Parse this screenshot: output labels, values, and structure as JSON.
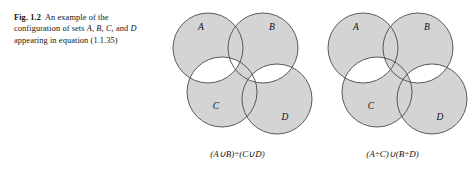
{
  "caption": {
    "label": "Fig. 1.2",
    "text_parts": [
      "An example of the",
      "configuration of sets ",
      "A, B, C,",
      "and ",
      "D",
      " appearing in",
      "equation (1.1.35)"
    ],
    "full_text": "Fig. 1.2 An example of the configuration of sets A, B, C, and D appearing in equation (1.1.35)"
  },
  "style": {
    "fill_shaded": "#d4d4d4",
    "fill_unshaded": "#ffffff",
    "stroke": "#4a4a4a",
    "stroke_width": 0.9,
    "text_color": "#141414"
  },
  "diagrams": [
    {
      "id": "left",
      "formula": "(A∪B)÷(C∪D)",
      "formula_tokens": [
        "(",
        "A",
        "∪",
        "B",
        ")",
        "÷",
        "(",
        "C",
        "∪",
        "D",
        ")"
      ],
      "description": "symmetric difference of the union of A and B with the union of C and D",
      "circles": [
        {
          "name": "A",
          "cx": 48,
          "cy": 44,
          "r": 35,
          "label": "A",
          "label_x": 41,
          "label_y": 26
        },
        {
          "name": "B",
          "cx": 103,
          "cy": 44,
          "r": 35,
          "label": "B",
          "label_x": 112,
          "label_y": 26
        },
        {
          "name": "C",
          "cx": 62,
          "cy": 88,
          "r": 35,
          "label": "C",
          "label_x": 56,
          "label_y": 105
        },
        {
          "name": "D",
          "cx": 117,
          "cy": 95,
          "r": 35,
          "label": "D",
          "label_x": 125,
          "label_y": 116
        }
      ],
      "unshaded_lenses": [
        [
          "A",
          "C"
        ],
        [
          "B",
          "D"
        ]
      ],
      "unshaded_mode": "full-lens"
    },
    {
      "id": "right",
      "formula": "(A÷C)∪(B÷D)",
      "formula_tokens": [
        "(",
        "A",
        "÷",
        "C",
        ")",
        "∪",
        "(",
        "B",
        "÷",
        "D",
        ")"
      ],
      "description": "union of the symmetric difference of A and C with the symmetric difference of B and D",
      "circles": [
        {
          "name": "A",
          "cx": 48,
          "cy": 44,
          "r": 35,
          "label": "A",
          "label_x": 41,
          "label_y": 26
        },
        {
          "name": "B",
          "cx": 103,
          "cy": 44,
          "r": 35,
          "label": "B",
          "label_x": 112,
          "label_y": 26
        },
        {
          "name": "C",
          "cx": 62,
          "cy": 88,
          "r": 35,
          "label": "C",
          "label_x": 56,
          "label_y": 105
        },
        {
          "name": "D",
          "cx": 117,
          "cy": 95,
          "r": 35,
          "label": "D",
          "label_x": 125,
          "label_y": 116
        }
      ],
      "unshaded_lenses": [
        [
          "A",
          "C"
        ],
        [
          "B",
          "D"
        ]
      ],
      "unshaded_subtract": {
        "A,C": "B",
        "B,D": "C"
      },
      "unshaded_mode": "lens-minus-third"
    }
  ]
}
